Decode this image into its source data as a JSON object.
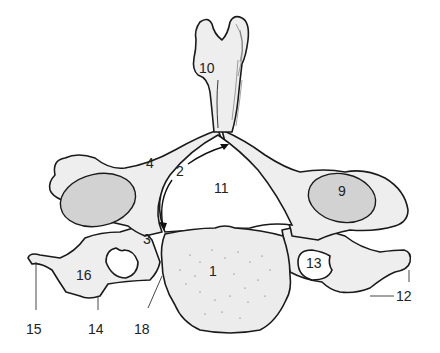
{
  "figure": {
    "labels": [
      {
        "id": "1",
        "text": "1",
        "x": 209,
        "y": 272
      },
      {
        "id": "2",
        "text": "2",
        "x": 176,
        "y": 172
      },
      {
        "id": "3",
        "text": "3",
        "x": 143,
        "y": 240
      },
      {
        "id": "4",
        "text": "4",
        "x": 146,
        "y": 164
      },
      {
        "id": "9",
        "text": "9",
        "x": 338,
        "y": 191
      },
      {
        "id": "10",
        "text": "10",
        "x": 197,
        "y": 68
      },
      {
        "id": "11",
        "text": "11",
        "x": 214,
        "y": 186
      },
      {
        "id": "12",
        "text": "12",
        "x": 396,
        "y": 289
      },
      {
        "id": "13",
        "text": "13",
        "x": 307,
        "y": 254
      },
      {
        "id": "14",
        "text": "14",
        "x": 88,
        "y": 320
      },
      {
        "id": "15",
        "text": "15",
        "x": 25,
        "y": 320
      },
      {
        "id": "16",
        "text": "16",
        "x": 77,
        "y": 267
      },
      {
        "id": "18",
        "text": "18",
        "x": 133,
        "y": 320
      }
    ]
  }
}
